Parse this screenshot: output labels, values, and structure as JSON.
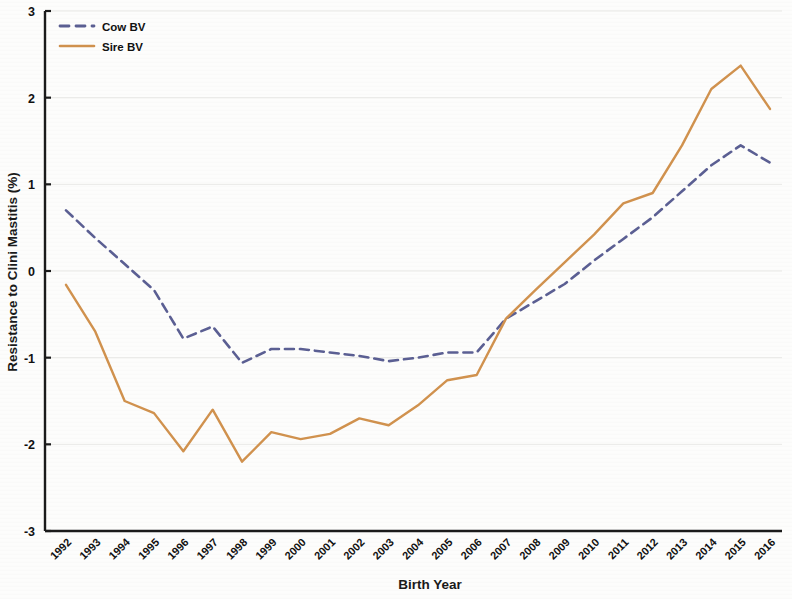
{
  "chart_data": {
    "type": "line",
    "title": "",
    "xlabel": "Birth Year",
    "ylabel": "Resistance to Clini Mastitis (%)",
    "ylim": [
      -3,
      3
    ],
    "yticks": [
      3,
      2,
      1,
      0,
      -1,
      -2,
      -3
    ],
    "ytick_labels": [
      "3",
      "2",
      "1",
      "0",
      "-1",
      "-2",
      "-3"
    ],
    "grid": true,
    "legend_position": "top-left",
    "categories": [
      "1992",
      "1993",
      "1994",
      "1995",
      "1996",
      "1997",
      "1998",
      "1999",
      "2000",
      "2001",
      "2002",
      "2003",
      "2004",
      "2005",
      "2006",
      "2007",
      "2008",
      "2009",
      "2010",
      "2011",
      "2012",
      "2013",
      "2014",
      "2015",
      "2016"
    ],
    "series": [
      {
        "name": "Cow BV",
        "color": "#5b5f93",
        "style": "dashed",
        "values": [
          0.7,
          0.38,
          0.08,
          -0.22,
          -0.78,
          -0.64,
          -1.06,
          -0.9,
          -0.9,
          -0.94,
          -0.98,
          -1.04,
          -1.0,
          -0.94,
          -0.94,
          -0.55,
          -0.35,
          -0.15,
          0.12,
          0.37,
          0.62,
          0.92,
          1.22,
          1.45,
          1.25
        ]
      },
      {
        "name": "Sire BV",
        "color": "#d1924e",
        "style": "solid",
        "values": [
          -0.16,
          -0.7,
          -1.5,
          -1.64,
          -2.08,
          -1.6,
          -2.2,
          -1.86,
          -1.94,
          -1.88,
          -1.7,
          -1.78,
          -1.55,
          -1.26,
          -1.2,
          -0.55,
          -0.22,
          0.1,
          0.42,
          0.78,
          0.9,
          1.45,
          2.1,
          2.37,
          1.87
        ]
      }
    ]
  },
  "legend": {
    "items": [
      {
        "label": "Cow BV",
        "color": "#5b5f93",
        "style": "dashed"
      },
      {
        "label": "Sire BV",
        "color": "#d1924e",
        "style": "solid"
      }
    ]
  }
}
